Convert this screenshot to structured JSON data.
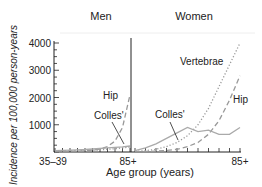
{
  "chart_data": {
    "type": "line",
    "ylabel": "Incidence per 100,000 person-years",
    "xlabel": "Age group (years)",
    "ylim": [
      0,
      4000
    ],
    "yticks": [
      1000,
      2000,
      3000,
      4000
    ],
    "grid": false,
    "panels": [
      {
        "title": "Men",
        "categories": [
          "35-39",
          "40-44",
          "45-49",
          "50-54",
          "55-59",
          "60-64",
          "65-69",
          "70-74",
          "75-79",
          "80-84",
          "85+"
        ],
        "xtick_labels": [
          "35–39",
          "85+"
        ],
        "series": [
          {
            "name": "Hip",
            "style": "dashed",
            "values": [
              10,
              15,
              20,
              30,
              45,
              70,
              110,
              200,
              400,
              900,
              2100
            ]
          },
          {
            "name": "Colles'",
            "style": "solid",
            "values": [
              50,
              60,
              70,
              80,
              90,
              110,
              130,
              150,
              170,
              190,
              220
            ]
          },
          {
            "name": "Vertebrae",
            "style": "dotted",
            "values": [
              20,
              25,
              30,
              40,
              50,
              60,
              80,
              100,
              120,
              150,
              180
            ]
          }
        ],
        "labels": [
          {
            "text": "Hip",
            "series": "Hip"
          },
          {
            "text": "Colles'",
            "series": "Colles'"
          }
        ]
      },
      {
        "title": "Women",
        "categories": [
          "35-39",
          "40-44",
          "45-49",
          "50-54",
          "55-59",
          "60-64",
          "65-69",
          "70-74",
          "75-79",
          "80-84",
          "85+"
        ],
        "xtick_labels": [
          "85+"
        ],
        "series": [
          {
            "name": "Vertebrae",
            "style": "dotted",
            "values": [
              20,
              50,
              100,
              200,
              350,
              600,
              1000,
              1600,
              2400,
              3200,
              4000
            ]
          },
          {
            "name": "Hip",
            "style": "dashed",
            "values": [
              10,
              20,
              30,
              60,
              100,
              200,
              350,
              650,
              1150,
              1900,
              2800
            ]
          },
          {
            "name": "Colles'",
            "style": "solid",
            "values": [
              50,
              150,
              300,
              500,
              700,
              900,
              750,
              800,
              650,
              650,
              900
            ]
          }
        ],
        "labels": [
          {
            "text": "Vertebrae",
            "series": "Vertebrae"
          },
          {
            "text": "Hip",
            "series": "Hip"
          },
          {
            "text": "Colles'",
            "series": "Colles'"
          }
        ]
      }
    ]
  }
}
